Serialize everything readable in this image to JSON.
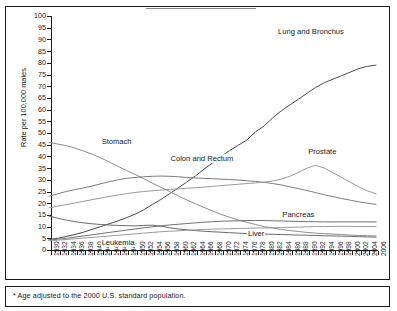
{
  "footnote": "* Age adjusted to the 2000 U.S. standard population.",
  "axes": {
    "ylabel": "Rate per 100,000 males",
    "xlabel": "Year of death"
  },
  "chart_data": {
    "type": "line",
    "title": "",
    "subtitle": "",
    "xlabel": "Year of death",
    "ylabel": "Rate per 100,000 males",
    "xlim": [
      1930,
      2006
    ],
    "ylim": [
      0,
      100
    ],
    "ytick_step": 5,
    "xtick_step": 2,
    "grid": false,
    "legend": "inline-annotations",
    "annotation": "* Age adjusted to the 2000 U.S. standard population.",
    "x": [
      1930,
      1932,
      1934,
      1936,
      1938,
      1940,
      1942,
      1944,
      1946,
      1948,
      1950,
      1952,
      1954,
      1956,
      1958,
      1960,
      1962,
      1964,
      1966,
      1968,
      1970,
      1972,
      1974,
      1976,
      1978,
      1980,
      1982,
      1984,
      1986,
      1988,
      1990,
      1992,
      1994,
      1996,
      1998,
      2000,
      2002,
      2004,
      2006
    ],
    "ytick_labels": [
      0,
      5,
      10,
      15,
      20,
      25,
      30,
      35,
      40,
      45,
      50,
      55,
      60,
      65,
      70,
      75,
      80,
      85,
      90,
      95,
      100
    ],
    "xtick_labels": [
      1930,
      1932,
      1934,
      1936,
      1938,
      1940,
      1942,
      1944,
      1946,
      1948,
      1950,
      1952,
      1954,
      1956,
      1958,
      1960,
      1962,
      1964,
      1966,
      1968,
      1970,
      1972,
      1974,
      1976,
      1978,
      1980,
      1982,
      1984,
      1986,
      1988,
      1990,
      1992,
      1994,
      1996,
      1998,
      2000,
      2002,
      2004,
      2006
    ],
    "series": [
      {
        "name": "Lung and Bronchus",
        "label": "Lung and Bronchus",
        "color": "#4a4a4a",
        "label_x": 1983,
        "label_y": 93,
        "values": [
          4.5,
          5.0,
          5.8,
          6.6,
          7.6,
          8.8,
          10.0,
          11.2,
          12.4,
          13.8,
          15.3,
          17.2,
          19.4,
          21.6,
          24.0,
          26.5,
          29.0,
          31.6,
          34.5,
          37.2,
          40.0,
          42.5,
          44.8,
          47.0,
          50.5,
          53.0,
          56.5,
          59.5,
          62.0,
          64.5,
          67.0,
          69.5,
          71.5,
          73.0,
          74.5,
          76.0,
          77.5,
          78.5,
          79.0
        ]
      },
      {
        "name": "Stomach",
        "label": "Stomach",
        "color": "#8e8e8e",
        "label_x": 1942,
        "label_y": 46,
        "values": [
          46.0,
          45.3,
          44.6,
          43.6,
          42.3,
          41.0,
          39.4,
          37.6,
          35.8,
          34.0,
          32.3,
          30.5,
          28.6,
          26.8,
          25.0,
          23.2,
          21.4,
          19.8,
          18.2,
          16.7,
          15.2,
          14.0,
          12.8,
          11.8,
          10.9,
          10.0,
          9.4,
          8.8,
          8.3,
          7.9,
          7.5,
          7.2,
          7.0,
          6.8,
          6.6,
          6.4,
          6.2,
          6.1,
          6.0
        ]
      },
      {
        "name": "Colon and Rectum",
        "label": "Colon and Rectum",
        "color": "#7d7d7d",
        "label_x": 1958,
        "label_y": 39,
        "values": [
          23.0,
          24.0,
          25.0,
          25.8,
          26.5,
          27.3,
          28.3,
          29.2,
          30.0,
          30.6,
          31.0,
          31.3,
          31.5,
          31.6,
          31.5,
          31.3,
          31.0,
          30.8,
          30.6,
          30.5,
          30.3,
          30.1,
          29.9,
          29.6,
          29.3,
          28.9,
          28.4,
          27.8,
          27.0,
          26.2,
          25.4,
          24.5,
          23.6,
          22.8,
          22.0,
          21.3,
          20.6,
          20.0,
          19.5
        ]
      },
      {
        "name": "Prostate",
        "label": "Prostate",
        "color": "#9a9a9a",
        "label_x": 1990,
        "label_y": 42,
        "values": [
          18.0,
          18.7,
          19.4,
          20.1,
          20.8,
          21.5,
          22.2,
          22.9,
          23.5,
          24.1,
          24.6,
          25.0,
          25.3,
          25.6,
          25.9,
          26.1,
          26.4,
          26.6,
          26.9,
          27.2,
          27.5,
          27.8,
          28.1,
          28.4,
          28.7,
          29.0,
          29.5,
          30.3,
          31.5,
          33.2,
          35.0,
          36.2,
          35.0,
          33.0,
          31.0,
          29.0,
          27.0,
          25.3,
          24.0
        ]
      },
      {
        "name": "Liver",
        "label": "Liver",
        "color": "#6b6b6b",
        "label_x": 1976,
        "label_y": 7,
        "values": [
          14.5,
          13.6,
          12.8,
          12.1,
          11.6,
          11.2,
          10.9,
          10.7,
          10.5,
          10.4,
          10.3,
          10.5,
          10.6,
          10.2,
          9.5,
          9.0,
          8.6,
          8.3,
          8.0,
          7.8,
          7.6,
          7.4,
          7.2,
          7.0,
          6.9,
          6.8,
          6.7,
          6.6,
          6.5,
          6.4,
          6.3,
          6.2,
          6.1,
          6.0,
          5.9,
          5.8,
          5.7,
          5.6,
          5.5
        ]
      },
      {
        "name": "Pancreas",
        "label": "Pancreas",
        "color": "#707070",
        "label_x": 1984,
        "label_y": 15,
        "values": [
          4.2,
          4.6,
          5.0,
          5.5,
          6.0,
          6.5,
          7.0,
          7.5,
          8.0,
          8.5,
          9.0,
          9.5,
          9.9,
          10.3,
          10.7,
          11.0,
          11.3,
          11.6,
          11.9,
          12.1,
          12.3,
          12.4,
          12.5,
          12.6,
          12.6,
          12.6,
          12.5,
          12.4,
          12.3,
          12.2,
          12.1,
          12.1,
          12.0,
          12.0,
          12.0,
          12.0,
          12.0,
          12.0,
          12.0
        ]
      },
      {
        "name": "Leukemia",
        "label": "Leukemia",
        "color": "#9a9a9a",
        "label_x": 1942,
        "label_y": 3,
        "values": [
          4.0,
          4.2,
          4.5,
          4.8,
          5.1,
          5.4,
          5.7,
          6.0,
          6.3,
          6.6,
          6.9,
          7.2,
          7.5,
          7.8,
          8.0,
          8.2,
          8.4,
          8.6,
          8.8,
          8.9,
          9.0,
          9.1,
          9.2,
          9.3,
          9.4,
          9.4,
          9.5,
          9.6,
          9.7,
          9.8,
          9.9,
          10.0,
          10.0,
          10.1,
          10.1,
          10.1,
          10.0,
          10.0,
          10.0
        ]
      }
    ]
  }
}
